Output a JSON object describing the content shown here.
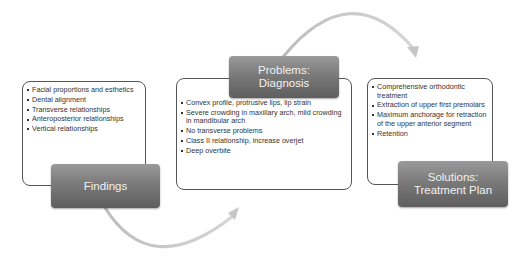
{
  "diagram": {
    "type": "cycle-flow",
    "colors": {
      "header_top": "#9a9a9a",
      "header_bottom": "#5e5e5e",
      "header_text": "#f2f2f2",
      "box_border": "#555555",
      "arrow": "#c8c8c8",
      "text": "#333333"
    },
    "stages": [
      {
        "title": "Findings",
        "title_lines": [
          "Findings"
        ],
        "items": [
          "Facial proportions and esthetics",
          "Dental alignment",
          "Transverse relationships",
          "Anteroposterior relationships",
          "Vertical relationships"
        ]
      },
      {
        "title": "Problems: Diagnosis",
        "title_lines": [
          "Problems:",
          "Diagnosis"
        ],
        "items": [
          "Convex profile, protrusive lips, lip strain",
          "Severe crowding in maxillary arch, mild crowding in mandibular arch",
          "No transverse problems",
          "Class II relationship, increase overjet",
          "Deep overbite"
        ]
      },
      {
        "title": "Solutions: Treatment Plan",
        "title_lines": [
          "Solutions:",
          "Treatment Plan"
        ],
        "items": [
          "Comprehensive orthodontic treatment",
          "Extraction of upper first premolars",
          "Maximum anchorage for retraction of the upper anterior segment",
          "Retention"
        ]
      }
    ],
    "connectors": [
      {
        "from": "Findings",
        "to": "Problems: Diagnosis",
        "shape": "curved-arrow-below"
      },
      {
        "from": "Problems: Diagnosis",
        "to": "Solutions: Treatment Plan",
        "shape": "curved-arrow-above"
      }
    ]
  }
}
